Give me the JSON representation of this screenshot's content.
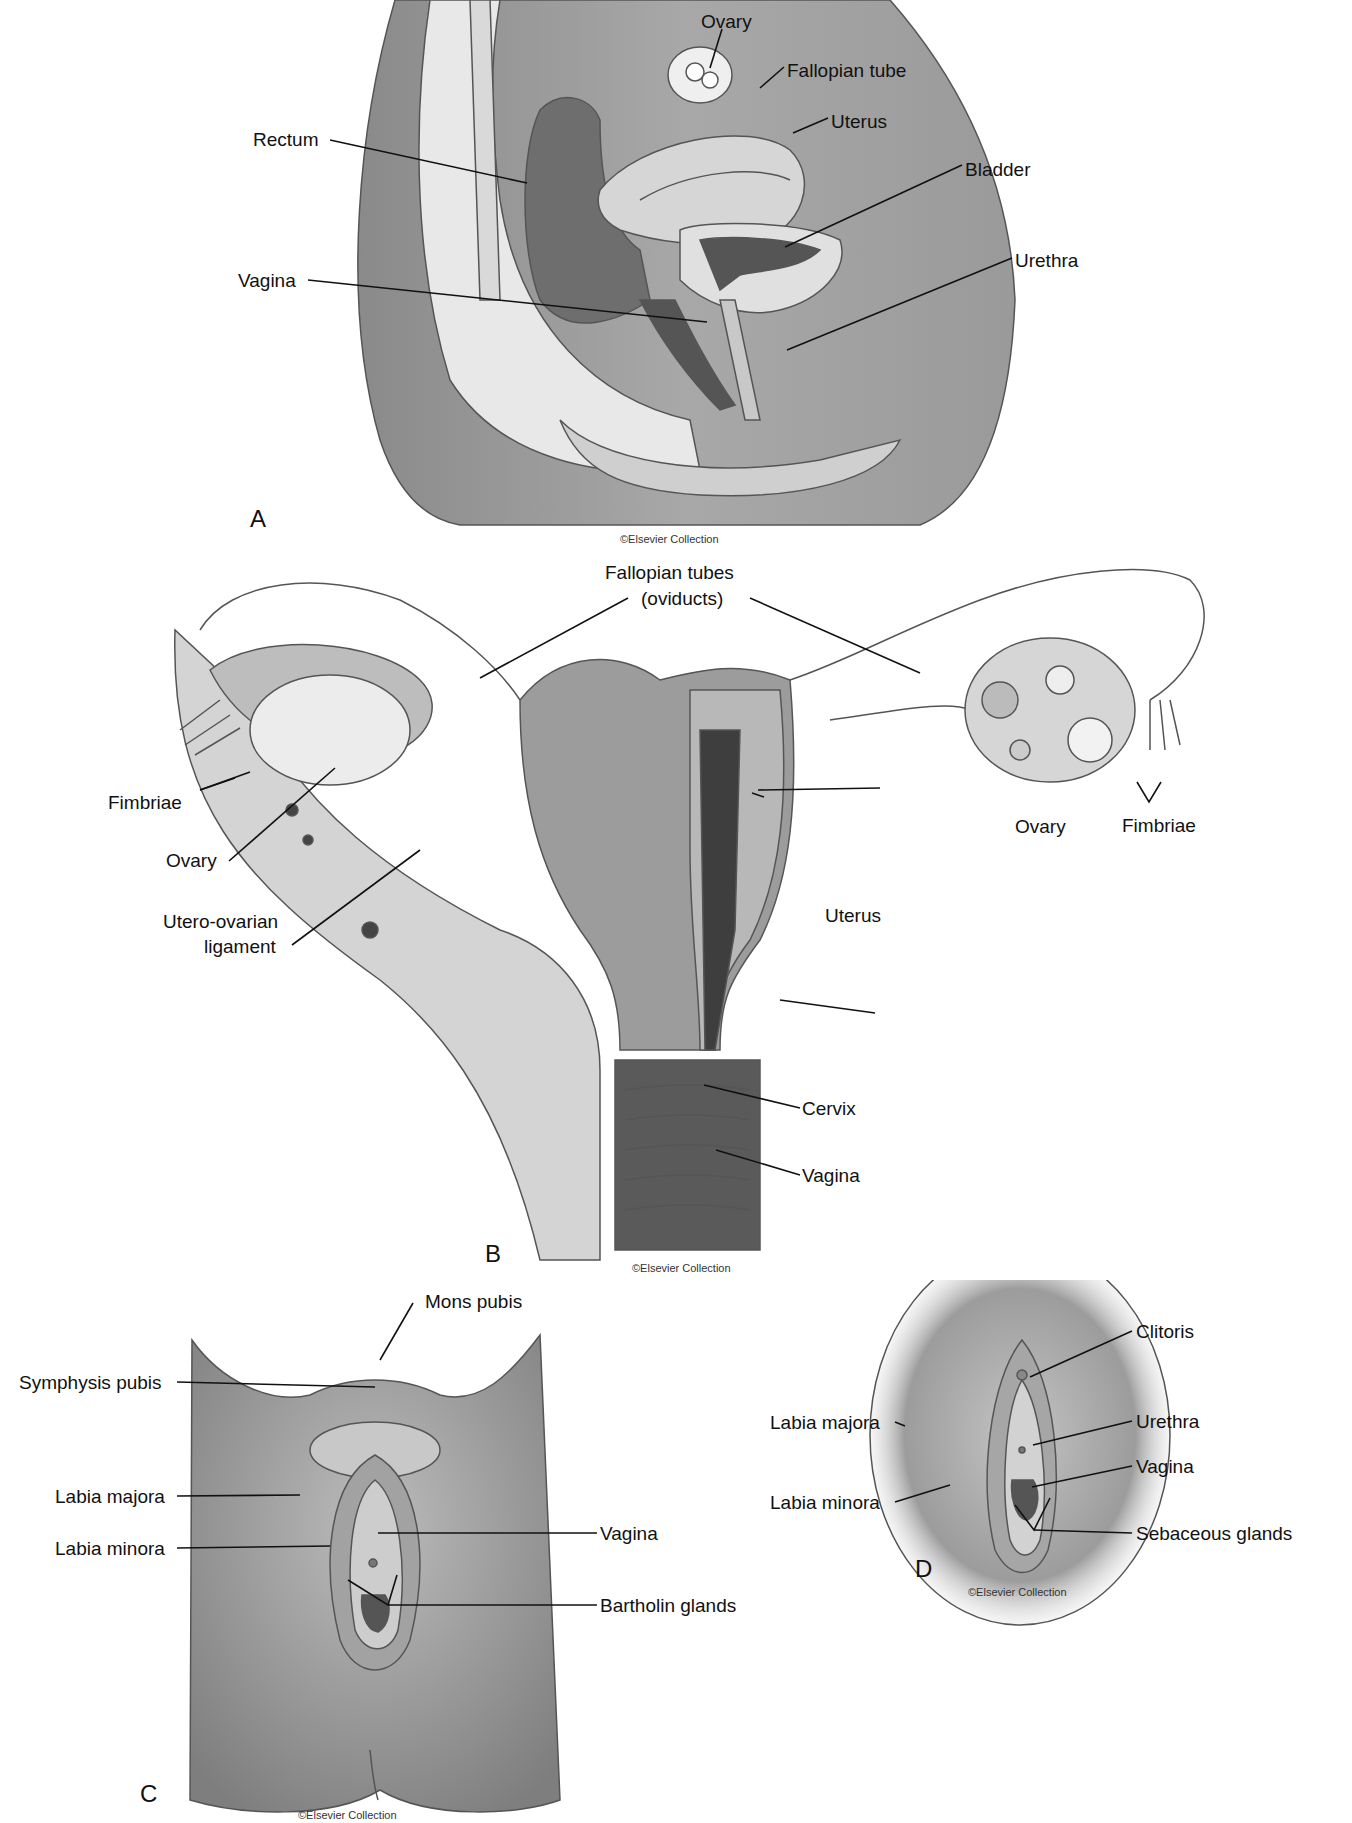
{
  "panels": {
    "a": {
      "letter": "A",
      "credit": "©Elsevier Collection",
      "labels": {
        "ovary": "Ovary",
        "fallopian_tube": "Fallopian tube",
        "uterus": "Uterus",
        "bladder": "Bladder",
        "urethra": "Urethra",
        "rectum": "Rectum",
        "vagina": "Vagina"
      }
    },
    "b": {
      "letter": "B",
      "credit": "©Elsevier Collection",
      "labels": {
        "fallopian_tubes": "Fallopian tubes",
        "oviducts": "(oviducts)",
        "fimbriae_left": "Fimbriae",
        "ovary_left": "Ovary",
        "utero_ovarian_1": "Utero-ovarian",
        "utero_ovarian_2": "ligament",
        "ovary_right": "Ovary",
        "fimbriae_right": "Fimbriae",
        "uterus": "Uterus",
        "cervix": "Cervix",
        "vagina": "Vagina"
      }
    },
    "c": {
      "letter": "C",
      "credit": "©Elsevier Collection",
      "labels": {
        "mons_pubis": "Mons pubis",
        "symphysis_pubis": "Symphysis pubis",
        "labia_majora": "Labia majora",
        "labia_minora": "Labia minora",
        "vagina": "Vagina",
        "bartholin_glands": "Bartholin glands"
      }
    },
    "d": {
      "letter": "D",
      "credit": "©Elsevier Collection",
      "labels": {
        "clitoris": "Clitoris",
        "labia_majora": "Labia majora",
        "urethra": "Urethra",
        "vagina": "Vagina",
        "labia_minora": "Labia minora",
        "sebaceous_glands": "Sebaceous glands"
      }
    }
  }
}
